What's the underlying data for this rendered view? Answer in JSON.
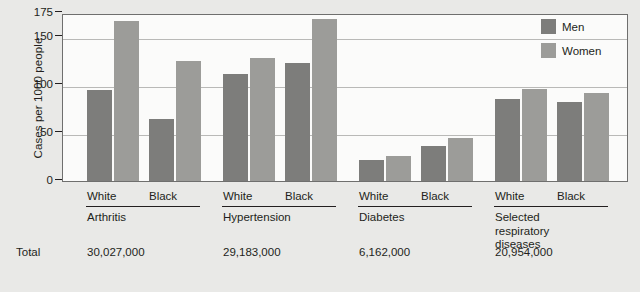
{
  "chart_data": {
    "type": "bar",
    "title": "",
    "xlabel": "",
    "ylabel": "Cases per 1000 people",
    "ylim": [
      0,
      175
    ],
    "yticks": [
      0,
      50,
      100,
      150,
      175
    ],
    "grid": true,
    "legend_position": "top-right",
    "legend": [
      "Men",
      "Women"
    ],
    "categories": [
      "Arthritis / White",
      "Arthritis / Black",
      "Hypertension / White",
      "Hypertension / Black",
      "Diabetes / White",
      "Diabetes / Black",
      "Selected respiratory diseases / White",
      "Selected respiratory diseases / Black"
    ],
    "series": [
      {
        "name": "Men",
        "values": [
          95,
          65,
          111,
          123,
          22,
          36,
          85,
          82
        ]
      },
      {
        "name": "Women",
        "values": [
          167,
          125,
          128,
          169,
          26,
          45,
          96,
          92
        ]
      }
    ],
    "groups": [
      {
        "name": "Arthritis",
        "total": "30,027,000",
        "races": [
          {
            "label": "White",
            "men": 95,
            "women": 167
          },
          {
            "label": "Black",
            "men": 65,
            "women": 125
          }
        ]
      },
      {
        "name": "Hypertension",
        "total": "29,183,000",
        "races": [
          {
            "label": "White",
            "men": 111,
            "women": 128
          },
          {
            "label": "Black",
            "men": 123,
            "women": 169
          }
        ]
      },
      {
        "name": "Diabetes",
        "total": "6,162,000",
        "races": [
          {
            "label": "White",
            "men": 22,
            "women": 26
          },
          {
            "label": "Black",
            "men": 36,
            "women": 45
          }
        ]
      },
      {
        "name": "Selected\nrespiratory\ndiseases",
        "total": "20,954,000",
        "races": [
          {
            "label": "White",
            "men": 85,
            "women": 96
          },
          {
            "label": "Black",
            "men": 82,
            "women": 92
          }
        ]
      }
    ]
  },
  "axis": {
    "ylabel": "Cases per 1000 people",
    "tick_175": "175",
    "tick_150": "150",
    "tick_100": "100",
    "tick_50": "50",
    "tick_0": "0"
  },
  "legend": {
    "men_label": "Men",
    "women_label": "Women"
  },
  "totals_row": {
    "label": "Total"
  },
  "colors": {
    "men": "#7d7d7b",
    "women": "#9c9c99",
    "plot_background": "#fbfbfa",
    "page_background": "#e9e9e7",
    "gridline": "#b9b9b7",
    "frame": "#6f6f6e",
    "text": "#231f20"
  }
}
